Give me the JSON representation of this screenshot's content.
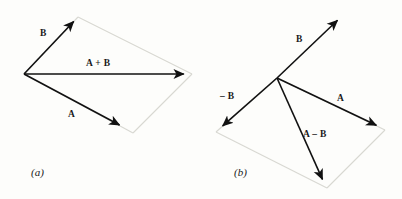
{
  "figure": {
    "background_color": "#fdfdfb",
    "vector_color": "#111111",
    "ghost_color": "#d8d8d2",
    "label_color": "#1a1a1a"
  },
  "panels": [
    {
      "id": "a",
      "caption": "(a)",
      "caption_pos": {
        "x": 31,
        "y": 176
      },
      "origin": {
        "x": 24,
        "y": 74
      },
      "vectors": [
        {
          "name": "B",
          "label": "B",
          "label_pos": {
            "x": 40,
            "y": 36
          },
          "from": {
            "x": 24,
            "y": 74
          },
          "to": {
            "x": 78,
            "y": 17
          }
        },
        {
          "name": "A+B",
          "label": "A + B",
          "label_pos": {
            "x": 86,
            "y": 66
          },
          "from": {
            "x": 24,
            "y": 74
          },
          "to": {
            "x": 190,
            "y": 74
          }
        },
        {
          "name": "A",
          "label": "A",
          "label_pos": {
            "x": 68,
            "y": 117
          },
          "from": {
            "x": 24,
            "y": 74
          },
          "to": {
            "x": 125,
            "y": 128
          }
        }
      ],
      "ghost_edges": [
        {
          "name": "b-tip-to-sum-tip",
          "from": {
            "x": 78,
            "y": 17
          },
          "to": {
            "x": 192,
            "y": 74
          }
        },
        {
          "name": "a-tip-to-sum-tip",
          "from": {
            "x": 133,
            "y": 133
          },
          "to": {
            "x": 192,
            "y": 74
          }
        },
        {
          "name": "origin-to-b-tip-edge",
          "from": {
            "x": 24,
            "y": 74
          },
          "to": {
            "x": 78,
            "y": 17
          }
        },
        {
          "name": "origin-to-a-tip-edge",
          "from": {
            "x": 24,
            "y": 74
          },
          "to": {
            "x": 133,
            "y": 133
          }
        }
      ]
    },
    {
      "id": "b",
      "caption": "(b)",
      "caption_pos": {
        "x": 234,
        "y": 176
      },
      "origin": {
        "x": 277,
        "y": 78
      },
      "vectors": [
        {
          "name": "B",
          "label": "B",
          "label_pos": {
            "x": 296,
            "y": 42
          },
          "from": {
            "x": 277,
            "y": 78
          },
          "to": {
            "x": 342,
            "y": 16
          }
        },
        {
          "name": "-B",
          "label": "– B",
          "label_pos": {
            "x": 220,
            "y": 99
          },
          "from": {
            "x": 277,
            "y": 78
          },
          "to": {
            "x": 218,
            "y": 130
          }
        },
        {
          "name": "A",
          "label": "A",
          "label_pos": {
            "x": 337,
            "y": 101
          },
          "from": {
            "x": 277,
            "y": 78
          },
          "to": {
            "x": 382,
            "y": 128
          }
        },
        {
          "name": "A-B",
          "label": "A – B",
          "label_pos": {
            "x": 303,
            "y": 137
          },
          "from": {
            "x": 277,
            "y": 78
          },
          "to": {
            "x": 325,
            "y": 185
          }
        }
      ],
      "ghost_edges": [
        {
          "name": "negb-tip-to-diff-tip",
          "from": {
            "x": 216,
            "y": 132
          },
          "to": {
            "x": 327,
            "y": 188
          }
        },
        {
          "name": "diff-tip-to-a-tip",
          "from": {
            "x": 327,
            "y": 188
          },
          "to": {
            "x": 385,
            "y": 130
          }
        },
        {
          "name": "negb-edge",
          "from": {
            "x": 277,
            "y": 78
          },
          "to": {
            "x": 216,
            "y": 132
          }
        },
        {
          "name": "a-edge",
          "from": {
            "x": 277,
            "y": 78
          },
          "to": {
            "x": 385,
            "y": 130
          }
        }
      ]
    }
  ]
}
